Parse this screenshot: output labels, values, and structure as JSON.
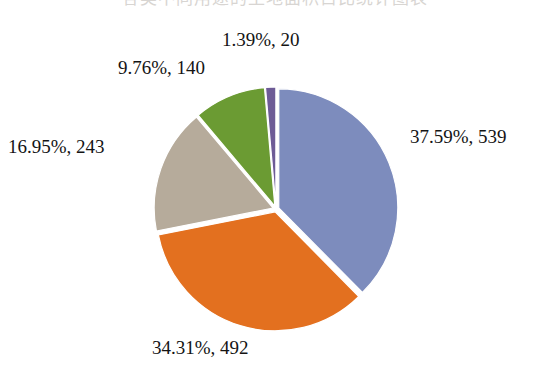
{
  "title": {
    "text": "各类不同用途的土地面积占比统计图表",
    "cropped": true
  },
  "chart_data": {
    "type": "pie",
    "title": "",
    "legend_position": "top-cropped",
    "grid": false,
    "total": 1434,
    "categories": [
      "Series 1",
      "Series 2",
      "Series 3",
      "Series 4",
      "Series 5"
    ],
    "labels": [
      "37.59%, 539",
      "34.31%, 492",
      "16.95%, 243",
      "9.76%, 140",
      "1.39%, 20"
    ],
    "values": [
      539,
      492,
      243,
      140,
      20
    ],
    "percents": [
      37.59,
      34.31,
      16.95,
      9.76,
      1.39
    ],
    "colors": [
      "#7d8cbd",
      "#e3701f",
      "#b6ab9b",
      "#6b9b33",
      "#6d5b96"
    ],
    "slices": [
      {
        "label": "37.59%, 539",
        "percent": 37.59,
        "value": 539,
        "color": "#7d8cbd",
        "name": "slice-blue"
      },
      {
        "label": "34.31%, 492",
        "percent": 34.31,
        "value": 492,
        "color": "#e3701f",
        "name": "slice-orange"
      },
      {
        "label": "16.95%, 243",
        "percent": 16.95,
        "value": 243,
        "color": "#b6ab9b",
        "name": "slice-tan"
      },
      {
        "label": "9.76%, 140",
        "percent": 9.76,
        "value": 140,
        "color": "#6b9b33",
        "name": "slice-green"
      },
      {
        "label": "1.39%, 20",
        "percent": 1.39,
        "value": 20,
        "color": "#6d5b96",
        "name": "slice-purple"
      }
    ],
    "geometry": {
      "cx": 276,
      "cy": 209,
      "r": 119,
      "start_angle_deg": 0,
      "explode_gap_px": 3.0,
      "separator_color": "#ffffff"
    }
  }
}
